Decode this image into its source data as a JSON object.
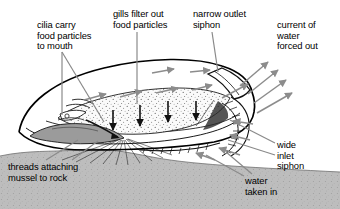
{
  "diagram": {
    "subject": "mussel",
    "background_color": "#ffffff",
    "text_color": "#000000",
    "leader_line_color": "#808080",
    "flow_arrow_color": "#8c8c8c",
    "gill_arrow_color": "#111111",
    "outline_color": "#000000",
    "rock_color": "#b8b8b8",
    "gill_fill_color": "#f2f2f2"
  },
  "labels": {
    "cilia": {
      "name": "cilia-label",
      "text": "cilia carry\nfood particles\nto mouth",
      "lines": [
        "cilia carry",
        "food particles",
        "to mouth"
      ]
    },
    "gills": {
      "name": "gills-label",
      "text": "gills filter out\nfood particles",
      "lines": [
        "gills filter out",
        "food particles"
      ]
    },
    "outlet_siphon": {
      "name": "outlet-siphon-label",
      "text": "narrow outlet\nsiphon",
      "lines": [
        "narrow outlet",
        "siphon"
      ]
    },
    "current_out": {
      "name": "current-out-label",
      "text": "current of\nwater\nforced out",
      "lines": [
        "current of",
        "water",
        "forced out"
      ]
    },
    "inlet_siphon": {
      "name": "inlet-siphon-label",
      "text": "wide\ninlet\nsiphon",
      "lines": [
        "wide",
        "inlet",
        "siphon"
      ]
    },
    "water_in": {
      "name": "water-in-label",
      "text": "water\ntaken in",
      "lines": [
        "water",
        "taken in"
      ]
    },
    "threads": {
      "name": "threads-label",
      "text": "threads attaching\nmussel to rock",
      "lines": [
        "threads attaching",
        "mussel to rock"
      ]
    }
  },
  "structures": [
    {
      "name": "shell",
      "description": "mussel shell outline, elongated wedge"
    },
    {
      "name": "gill",
      "description": "stippled lens-shaped gill inside shell"
    },
    {
      "name": "foot",
      "description": "dark tongue-shaped foot at lower left of body"
    },
    {
      "name": "mantle-edge",
      "description": "frilly fringed mantle margin at inlet siphon"
    },
    {
      "name": "byssal-threads",
      "description": "fan of thin threads anchoring mussel to rock"
    },
    {
      "name": "rock",
      "description": "stippled grey substrate band across lower image"
    }
  ]
}
